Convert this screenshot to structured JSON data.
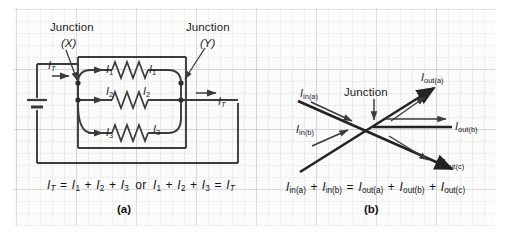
{
  "figure": {
    "background_color": "#ffffff",
    "grid_color": "#969ea6",
    "ink_color": "#3a3a40"
  },
  "panel_a": {
    "label": "(a)",
    "junction_x_title": "Junction",
    "junction_x_name": "(X)",
    "junction_y_title": "Junction",
    "junction_y_name": "(Y)",
    "current_total_left": "I",
    "current_total_left_sub": "T",
    "current_total_right": "I",
    "current_total_right_sub": "T",
    "branch_labels": [
      {
        "symbol": "I",
        "sub": "1",
        "side": "left"
      },
      {
        "symbol": "I",
        "sub": "1",
        "side": "right"
      },
      {
        "symbol": "I",
        "sub": "2",
        "side": "left"
      },
      {
        "symbol": "I",
        "sub": "2",
        "side": "right"
      },
      {
        "symbol": "I",
        "sub": "3",
        "side": "left"
      },
      {
        "symbol": "I",
        "sub": "3",
        "side": "right"
      }
    ],
    "components": {
      "battery": "battery-symbol",
      "resistor_1": "resistor-symbol",
      "resistor_2": "resistor-symbol",
      "resistor_3": "resistor-symbol"
    },
    "equation_parts": {
      "lhs_sym": "I",
      "lhs_sub": "T",
      "eq": "=",
      "t1_sym": "I",
      "t1_sub": "1",
      "plus": "+",
      "t2_sym": "I",
      "t2_sub": "2",
      "t3_sym": "I",
      "t3_sub": "3",
      "or": "or"
    },
    "equation_text": "IT = I1 + I2 + I3  or  I1 + I2 + I3 = IT"
  },
  "panel_b": {
    "label": "(b)",
    "junction_title": "Junction",
    "arrows": [
      {
        "name": "I",
        "sub": "in(a)",
        "direction": "in"
      },
      {
        "name": "I",
        "sub": "in(b)",
        "direction": "in"
      },
      {
        "name": "I",
        "sub": "out(a)",
        "direction": "out"
      },
      {
        "name": "I",
        "sub": "out(b)",
        "direction": "out"
      },
      {
        "name": "I",
        "sub": "out(c)",
        "direction": "out"
      }
    ],
    "equation_parts": {
      "a_sym": "I",
      "a_sub": "in(a)",
      "b_sym": "I",
      "b_sub": "in(b)",
      "c_sym": "I",
      "c_sub": "out(a)",
      "d_sym": "I",
      "d_sub": "out(b)",
      "e_sym": "I",
      "e_sub": "out(c)",
      "plus": "+",
      "eq": "="
    },
    "equation_text": "Iin(a) + Iin(b) = Iout(a) + Iout(b) + Iout(c)"
  }
}
